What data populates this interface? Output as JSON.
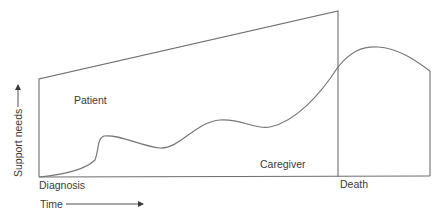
{
  "diagram": {
    "labels": {
      "patient": "Patient",
      "caregiver": "Caregiver",
      "diagnosis": "Diagnosis",
      "death": "Death",
      "x_axis": "Time",
      "y_axis": "Support needs"
    },
    "colors": {
      "line": "#6e6e6e",
      "text": "#3a3a3a",
      "background": "#ffffff"
    }
  }
}
